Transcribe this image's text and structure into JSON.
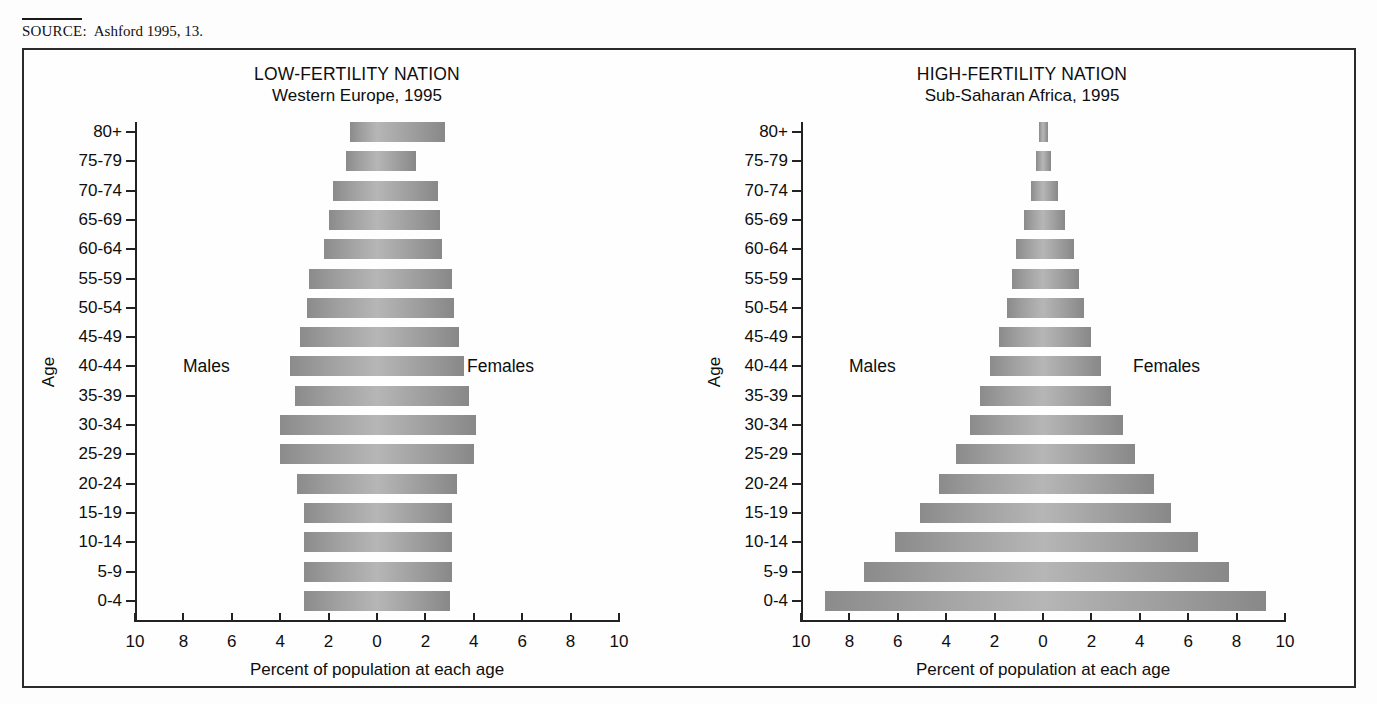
{
  "source": {
    "label": "SOURCE:",
    "text": "Ashford 1995, 13."
  },
  "axis": {
    "x_title": "Percent of population at each age",
    "y_title": "Age",
    "x_ticks": [
      "10",
      "8",
      "6",
      "4",
      "2",
      "0",
      "2",
      "4",
      "6",
      "8",
      "10"
    ],
    "x_tick_values": [
      -10,
      -8,
      -6,
      -4,
      -2,
      0,
      2,
      4,
      6,
      8,
      10
    ],
    "x_min": -10,
    "x_max": 10,
    "male_label": "Males",
    "female_label": "Females"
  },
  "age_groups": [
    "80+",
    "75-79",
    "70-74",
    "65-69",
    "60-64",
    "55-59",
    "50-54",
    "45-49",
    "40-44",
    "35-39",
    "30-34",
    "25-29",
    "20-24",
    "15-19",
    "10-14",
    "5-9",
    "0-4"
  ],
  "panels": [
    {
      "id": "low-fertility",
      "title": "LOW-FERTILITY NATION",
      "subtitle": "Western Europe, 1995"
    },
    {
      "id": "high-fertility",
      "title": "HIGH-FERTILITY NATION",
      "subtitle": "Sub-Saharan Africa, 1995"
    }
  ],
  "chart_data": [
    {
      "type": "bar",
      "title": "LOW-FERTILITY NATION",
      "subtitle": "Western Europe, 1995",
      "xlabel": "Percent of population at each age",
      "ylabel": "Age",
      "xlim": [
        -10,
        10
      ],
      "grid": false,
      "legend": [
        "Males",
        "Females"
      ],
      "legend_position": "inside-left-right",
      "categories": [
        "80+",
        "75-79",
        "70-74",
        "65-69",
        "60-64",
        "55-59",
        "50-54",
        "45-49",
        "40-44",
        "35-39",
        "30-34",
        "25-29",
        "20-24",
        "15-19",
        "10-14",
        "5-9",
        "0-4"
      ],
      "series": [
        {
          "name": "Males",
          "values": [
            1.1,
            1.3,
            1.8,
            2.0,
            2.2,
            2.8,
            2.9,
            3.2,
            3.6,
            3.4,
            4.0,
            4.0,
            3.3,
            3.0,
            3.0,
            3.0,
            3.0
          ]
        },
        {
          "name": "Females",
          "values": [
            2.8,
            1.6,
            2.5,
            2.6,
            2.7,
            3.1,
            3.2,
            3.4,
            3.6,
            3.8,
            4.1,
            4.0,
            3.3,
            3.1,
            3.1,
            3.1,
            3.0
          ]
        }
      ]
    },
    {
      "type": "bar",
      "title": "HIGH-FERTILITY NATION",
      "subtitle": "Sub-Saharan Africa, 1995",
      "xlabel": "Percent of population at each age",
      "ylabel": "Age",
      "xlim": [
        -10,
        10
      ],
      "grid": false,
      "legend": [
        "Males",
        "Females"
      ],
      "legend_position": "inside-left-right",
      "categories": [
        "80+",
        "75-79",
        "70-74",
        "65-69",
        "60-64",
        "55-59",
        "50-54",
        "45-49",
        "40-44",
        "35-39",
        "30-34",
        "25-29",
        "20-24",
        "15-19",
        "10-14",
        "5-9",
        "0-4"
      ],
      "series": [
        {
          "name": "Males",
          "values": [
            0.15,
            0.3,
            0.5,
            0.8,
            1.1,
            1.3,
            1.5,
            1.8,
            2.2,
            2.6,
            3.0,
            3.6,
            4.3,
            5.1,
            6.1,
            7.4,
            9.0
          ]
        },
        {
          "name": "Females",
          "values": [
            0.2,
            0.35,
            0.6,
            0.9,
            1.3,
            1.5,
            1.7,
            2.0,
            2.4,
            2.8,
            3.3,
            3.8,
            4.6,
            5.3,
            6.4,
            7.7,
            9.2
          ]
        }
      ]
    }
  ]
}
